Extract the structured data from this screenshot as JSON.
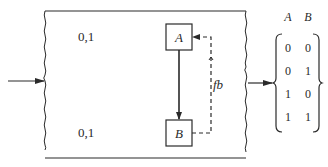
{
  "diagram": {
    "outer_box": {
      "labels": [
        {
          "text": "0,1",
          "position": "top-left"
        },
        {
          "text": "0,1",
          "position": "bottom-left"
        }
      ]
    },
    "nodes": [
      {
        "id": "A",
        "label": "A"
      },
      {
        "id": "B",
        "label": "B"
      }
    ],
    "edges": [
      {
        "from": "A",
        "to": "B",
        "style": "solid"
      },
      {
        "from": "B",
        "to": "A",
        "style": "dashed",
        "label": "fb"
      }
    ],
    "input_arrow": true,
    "output_arrow": true,
    "output_set": {
      "headers": [
        "A",
        "B"
      ],
      "rows": [
        [
          "0",
          "0"
        ],
        [
          "0",
          "1"
        ],
        [
          "1",
          "0"
        ],
        [
          "1",
          "1"
        ]
      ]
    },
    "colors": {
      "stroke": "#2a2a2a",
      "background": "#ffffff"
    }
  }
}
